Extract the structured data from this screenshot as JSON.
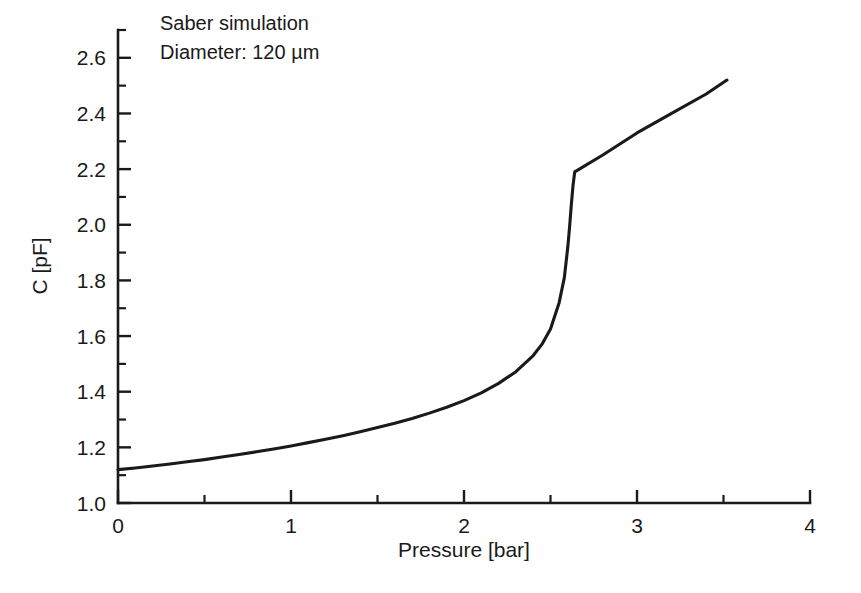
{
  "chart_data": {
    "type": "line",
    "title": "",
    "xlabel": "Pressure [bar]",
    "ylabel": "C [pF]",
    "xlim": [
      0,
      4
    ],
    "ylim": [
      1.0,
      2.7
    ],
    "grid": false,
    "legend": "none",
    "annotations": [
      "Saber simulation",
      "Diameter: 120 µm"
    ],
    "x_ticks_major": [
      0,
      1,
      2,
      3,
      4
    ],
    "x_tick_labels": [
      "0",
      "1",
      "2",
      "3",
      "4"
    ],
    "x_ticks_minor": [
      0.5,
      1.5,
      2.5,
      3.5
    ],
    "y_ticks_major": [
      1.0,
      1.2,
      1.4,
      1.6,
      1.8,
      2.0,
      2.2,
      2.4,
      2.6
    ],
    "y_tick_labels": [
      "1.0",
      "1.2",
      "1.4",
      "1.6",
      "1.8",
      "2.0",
      "2.2",
      "2.4",
      "2.6"
    ],
    "y_ticks_minor": [
      1.1,
      1.3,
      1.5,
      1.7,
      1.9,
      2.1,
      2.3,
      2.5,
      2.7
    ],
    "series": [
      {
        "name": "C vs pressure",
        "color": "#1a1a1a",
        "x": [
          0.0,
          0.1,
          0.2,
          0.3,
          0.4,
          0.5,
          0.6,
          0.7,
          0.8,
          0.9,
          1.0,
          1.1,
          1.2,
          1.3,
          1.4,
          1.5,
          1.6,
          1.7,
          1.8,
          1.9,
          2.0,
          2.1,
          2.2,
          2.3,
          2.4,
          2.45,
          2.5,
          2.55,
          2.58,
          2.6,
          2.61,
          2.62,
          2.63,
          2.64,
          2.8,
          3.0,
          3.2,
          3.4,
          3.52
        ],
        "y": [
          1.12,
          1.126,
          1.133,
          1.14,
          1.148,
          1.156,
          1.165,
          1.174,
          1.184,
          1.194,
          1.205,
          1.217,
          1.229,
          1.242,
          1.256,
          1.271,
          1.287,
          1.304,
          1.323,
          1.344,
          1.368,
          1.396,
          1.43,
          1.472,
          1.53,
          1.57,
          1.625,
          1.72,
          1.81,
          1.92,
          1.99,
          2.07,
          2.14,
          2.19,
          2.25,
          2.33,
          2.4,
          2.47,
          2.52
        ]
      }
    ]
  },
  "axes": {
    "x_axis_name": "pressure-axis",
    "y_axis_name": "capacitance-axis"
  }
}
